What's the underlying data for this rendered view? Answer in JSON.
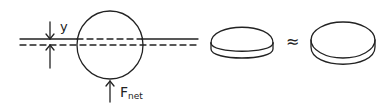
{
  "figure": {
    "labels": {
      "displacement": "y",
      "force_main": "F",
      "force_sub": "net",
      "approx_symbol": "≈"
    },
    "panels": [
      {
        "id": "floating-sphere",
        "description": "Sphere at water surface, displaced down by y; solid line = original waterline, dashed line = displaced waterline; upward net force arrow below"
      },
      {
        "id": "spherical-cap",
        "description": "Submerged cap of sphere (lens-shaped slice)"
      },
      {
        "id": "cylindrical-disc",
        "description": "Thin cylinder approximation of the cap"
      }
    ],
    "colors": {
      "ink": "#222222",
      "background": "#ffffff"
    }
  }
}
